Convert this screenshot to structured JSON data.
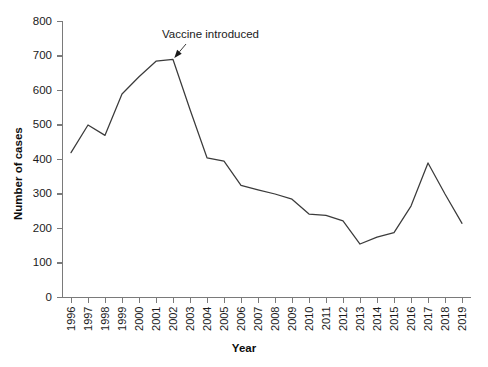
{
  "chart_data": {
    "type": "line",
    "title": "",
    "xlabel": "Year",
    "ylabel": "Number of cases",
    "categories": [
      "1996",
      "1997",
      "1998",
      "1999",
      "2000",
      "2001",
      "2002",
      "2003",
      "2004",
      "2005",
      "2006",
      "2007",
      "2008",
      "2009",
      "2010",
      "2011",
      "2012",
      "2013",
      "2014",
      "2015",
      "2016",
      "2017",
      "2018",
      "2019"
    ],
    "values": [
      420,
      500,
      470,
      590,
      640,
      685,
      690,
      545,
      405,
      395,
      325,
      312,
      300,
      285,
      242,
      238,
      222,
      155,
      175,
      188,
      265,
      390,
      300,
      215
    ],
    "series": [
      {
        "name": "Number of cases",
        "values": [
          420,
          500,
          470,
          590,
          640,
          685,
          690,
          545,
          405,
          395,
          325,
          312,
          300,
          285,
          242,
          238,
          222,
          155,
          175,
          188,
          265,
          390,
          300,
          215
        ]
      }
    ],
    "ylim": [
      0,
      800
    ],
    "yticks": [
      0,
      100,
      200,
      300,
      400,
      500,
      600,
      700,
      800
    ],
    "ytick_labels": [
      "0",
      "100",
      "200",
      "300",
      "400",
      "500",
      "600",
      "700",
      "800"
    ],
    "grid": false,
    "legend": "none",
    "line_color": "#3b3b3b",
    "axis_color": "#7a7a7a",
    "annotations": [
      {
        "text": "Vaccine introduced",
        "points_to_category": "2002",
        "points_to_value": 690
      }
    ]
  },
  "axes": {
    "y_title": "Number of cases",
    "x_title": "Year"
  },
  "annotation": {
    "label": "Vaccine introduced"
  }
}
